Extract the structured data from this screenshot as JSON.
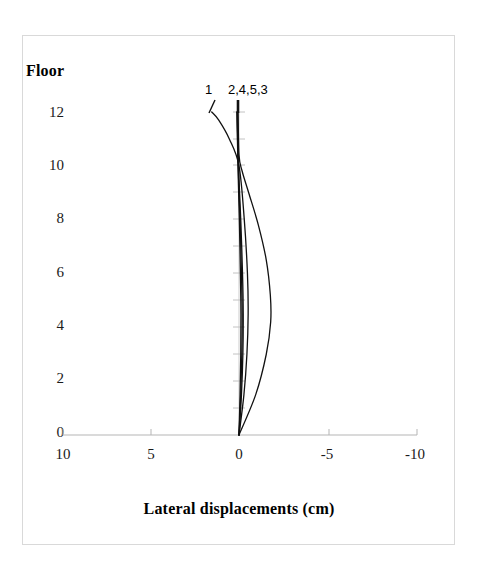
{
  "chart_data": {
    "type": "line",
    "title": "",
    "xlabel": "Lateral displacements (cm)",
    "ylabel": "Floor",
    "xlim": [
      10,
      -10
    ],
    "ylim": [
      0,
      12
    ],
    "x_ticks": [
      10,
      5,
      0,
      -5,
      -10
    ],
    "x_tick_labels": [
      "10",
      "5",
      "0",
      "-5",
      "-10"
    ],
    "y_ticks": [
      0,
      2,
      4,
      6,
      8,
      10,
      12
    ],
    "y_tick_labels": [
      "0",
      "2",
      "4",
      "6",
      "8",
      "10",
      "12"
    ],
    "x_axis_reversed": true,
    "grid": false,
    "legend_position": "top-inside",
    "legend_entries": [
      "1",
      "2,4,5,3"
    ],
    "line_color": "#111111",
    "axis_color": "#b0b0b0",
    "frame_color": "#d9d9d9",
    "series": [
      {
        "name": "1",
        "comment": "crosses zero near floor 10, positive above, slight negative below",
        "x": [
          0.0,
          -0.28,
          -0.45,
          -0.52,
          -0.48,
          -0.3,
          0.0,
          0.55,
          1.15,
          1.55
        ],
        "y": [
          0,
          1.5,
          3,
          4.5,
          6,
          8,
          10,
          11,
          11.7,
          12
        ]
      },
      {
        "name": "2",
        "comment": "large bulge toward negative side peaking near floor 4",
        "x": [
          0.0,
          -0.95,
          -1.55,
          -1.8,
          -1.78,
          -1.55,
          -1.1,
          -0.55,
          -0.18,
          0.0,
          0.05
        ],
        "y": [
          0,
          1.5,
          3,
          4.2,
          5.2,
          6.5,
          7.8,
          9.0,
          9.8,
          10.4,
          12
        ]
      },
      {
        "name": "4",
        "comment": "near-vertical line, very small displacement",
        "x": [
          0.0,
          -0.1,
          -0.16,
          -0.18,
          -0.14,
          -0.06,
          0.02,
          0.08,
          0.1
        ],
        "y": [
          0,
          1.5,
          3,
          4.5,
          6,
          8,
          9.5,
          11,
          12
        ]
      },
      {
        "name": "5",
        "comment": "near-vertical line, very small displacement",
        "x": [
          0.0,
          -0.06,
          -0.1,
          -0.11,
          -0.08,
          -0.02,
          0.04,
          0.09,
          0.12
        ],
        "y": [
          0,
          1.5,
          3,
          4.5,
          6,
          8,
          9.5,
          11,
          12
        ]
      },
      {
        "name": "3",
        "comment": "near-vertical line, very small displacement",
        "x": [
          0.0,
          -0.14,
          -0.22,
          -0.24,
          -0.2,
          -0.1,
          0.0,
          0.07,
          0.09
        ],
        "y": [
          0,
          1.5,
          3,
          4.5,
          6,
          8,
          9.5,
          11,
          12
        ]
      }
    ]
  },
  "figure": {
    "y_axis_title": "Floor",
    "x_axis_title": "Lateral displacements (cm)",
    "legend": {
      "entry_1": "1",
      "entry_2": "2,4,5,3"
    },
    "y_tick_labels": [
      "12",
      "10",
      "8",
      "6",
      "4",
      "2",
      "0"
    ],
    "x_tick_labels": [
      "10",
      "5",
      "0",
      "-5",
      "-10"
    ]
  }
}
